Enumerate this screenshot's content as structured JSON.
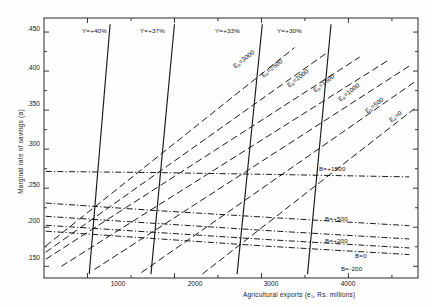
{
  "chart_data": {
    "type": "line",
    "title": "",
    "xlabel": "Agricultural exports (e₁, Rs. millions)",
    "ylabel": "Marginal rate of savings (α)",
    "xlim": [
      500,
      4800
    ],
    "ylim": [
      0.135,
      0.468
    ],
    "grid": false,
    "legend_position": "inline-labels",
    "xticks": [
      1000,
      2000,
      3000,
      4000
    ],
    "xtick_labels": [
      "1000",
      "2000",
      "3000",
      "4000"
    ],
    "yticks": [
      0.15,
      0.2,
      0.25,
      0.3,
      0.35,
      0.4,
      0.45
    ],
    "ytick_labels": [
      ".150",
      ".200",
      ".250",
      ".300",
      ".350",
      ".400",
      ".450"
    ],
    "series": [
      {
        "name": "Y=+40%",
        "style": "solid",
        "label": "Y=+40%",
        "points": [
          [
            1020,
            0.14
          ],
          [
            1260,
            0.46
          ]
        ]
      },
      {
        "name": "Y=+37%",
        "style": "solid",
        "label": "Y=+37%",
        "points": [
          [
            1730,
            0.14
          ],
          [
            2000,
            0.46
          ]
        ]
      },
      {
        "name": "Y=+33%",
        "style": "solid",
        "label": "Y=+33%",
        "points": [
          [
            2720,
            0.14
          ],
          [
            3010,
            0.46
          ]
        ]
      },
      {
        "name": "Y=+30%",
        "style": "solid",
        "label": "Y=+30%",
        "points": [
          [
            3530,
            0.14
          ],
          [
            3800,
            0.46
          ]
        ]
      },
      {
        "name": "Es=3000",
        "style": "dashed",
        "label": "Eₛ=3000",
        "points": [
          [
            520,
            0.176
          ],
          [
            3380,
            0.43
          ]
        ]
      },
      {
        "name": "Es=2500",
        "style": "dashed",
        "label": "Eₛ=2500",
        "points": [
          [
            520,
            0.168
          ],
          [
            3760,
            0.424
          ]
        ]
      },
      {
        "name": "Es=2000",
        "style": "dashed",
        "label": "Eₛ=2000",
        "points": [
          [
            520,
            0.159
          ],
          [
            4130,
            0.418
          ]
        ]
      },
      {
        "name": "Es=1500",
        "style": "dashed",
        "label": "Eₛ=1500",
        "points": [
          [
            700,
            0.15
          ],
          [
            4460,
            0.414
          ]
        ]
      },
      {
        "name": "Es=1000",
        "style": "dashed",
        "label": "Eₛ=1000",
        "points": [
          [
            1080,
            0.146
          ],
          [
            4720,
            0.408
          ]
        ]
      },
      {
        "name": "Es=500",
        "style": "dashed",
        "label": "Eₛ=500",
        "points": [
          [
            1620,
            0.142
          ],
          [
            4760,
            0.386
          ]
        ]
      },
      {
        "name": "Es=0",
        "style": "dashed",
        "label": "Eₛ=0",
        "points": [
          [
            2320,
            0.14
          ],
          [
            4760,
            0.352
          ]
        ]
      },
      {
        "name": "B=+1500",
        "style": "dash-dot",
        "label": "B=+1500",
        "points": [
          [
            520,
            0.2715
          ],
          [
            1800,
            0.27
          ],
          [
            3200,
            0.2675
          ],
          [
            4700,
            0.2645
          ]
        ]
      },
      {
        "name": "B=+500",
        "style": "dash-dot",
        "label": "B=+500",
        "points": [
          [
            520,
            0.231
          ],
          [
            1700,
            0.222
          ],
          [
            3100,
            0.2125
          ],
          [
            4700,
            0.202
          ]
        ]
      },
      {
        "name": "B=+200",
        "style": "dash-dot",
        "label": "B=+200",
        "points": [
          [
            520,
            0.214
          ],
          [
            1700,
            0.2055
          ],
          [
            3100,
            0.1955
          ],
          [
            4700,
            0.185
          ]
        ]
      },
      {
        "name": "B=0",
        "style": "dash-dot",
        "label": "B=0",
        "points": [
          [
            520,
            0.2025
          ],
          [
            1700,
            0.194
          ],
          [
            3100,
            0.184
          ],
          [
            4700,
            0.1735
          ]
        ]
      },
      {
        "name": "B=-200",
        "style": "dash-dot",
        "label": "B=-200",
        "points": [
          [
            520,
            0.195
          ],
          [
            1700,
            0.186
          ],
          [
            3100,
            0.1755
          ],
          [
            4700,
            0.165
          ]
        ]
      }
    ],
    "annotations": [
      {
        "text": "Y=+40%",
        "x": 1045,
        "y": 0.452,
        "kind": "series-label"
      },
      {
        "text": "Y=+37%",
        "x": 1790,
        "y": 0.452,
        "kind": "series-label"
      },
      {
        "text": "Y=+33%",
        "x": 2765,
        "y": 0.452,
        "kind": "series-label"
      },
      {
        "text": "Y=+30%",
        "x": 3570,
        "y": 0.452,
        "kind": "series-label"
      },
      {
        "text": "Eₛ=3000",
        "x": 2280,
        "y": 0.405,
        "kind": "series-label"
      },
      {
        "text": "Eₛ=2500",
        "x": 2650,
        "y": 0.393,
        "kind": "series-label"
      },
      {
        "text": "Eₛ=2000",
        "x": 2980,
        "y": 0.381,
        "kind": "series-label"
      },
      {
        "text": "Eₛ=1500",
        "x": 3310,
        "y": 0.375,
        "kind": "series-label"
      },
      {
        "text": "Eₛ=1000",
        "x": 3640,
        "y": 0.363,
        "kind": "series-label"
      },
      {
        "text": "Eₛ=500",
        "x": 3990,
        "y": 0.348,
        "kind": "series-label"
      },
      {
        "text": "Eₛ=0",
        "x": 4300,
        "y": 0.337,
        "kind": "series-label"
      },
      {
        "text": "B=+1500",
        "x": 3540,
        "y": 0.2715,
        "kind": "series-label"
      },
      {
        "text": "B=+500",
        "x": 3540,
        "y": 0.215,
        "kind": "series-label"
      },
      {
        "text": "B=+200",
        "x": 3540,
        "y": 0.1985,
        "kind": "series-label"
      },
      {
        "text": "B=0",
        "x": 3960,
        "y": 0.18,
        "kind": "series-label"
      },
      {
        "text": "B=-200",
        "x": 3880,
        "y": 0.1655,
        "kind": "series-label"
      }
    ]
  },
  "axes": {
    "x_title": "Agricultural exports (e₁, Rs. millions)",
    "y_title": "Marginal rate of savings (α)",
    "x_labels": [
      "1000",
      "2000",
      "3000",
      "4000"
    ],
    "y_labels": [
      ".450",
      ".400",
      ".350",
      ".300",
      ".250",
      ".200",
      ".150"
    ]
  },
  "labels": {
    "y40": "Y=+40%",
    "y37": "Y=+37%",
    "y33": "Y=+33%",
    "y30": "Y=+30%",
    "es3000_prefix": "E",
    "es3000_sub": "s",
    "es3000_value": "=3000",
    "es2500_value": "=2500",
    "es2000_value": "=2000",
    "es1500_value": "=1500",
    "es1000_value": "=1000",
    "es500_value": "=500",
    "es0_value": "=0",
    "b1500": "B=+1500",
    "b500": "B=+500",
    "b200": "B=+200",
    "b0": "B=0",
    "bm200": "B=-200"
  },
  "colors": {
    "line": "#1a1a1a",
    "frame": "#3a3a3a",
    "text": "#141414",
    "background": "#fefefe"
  }
}
